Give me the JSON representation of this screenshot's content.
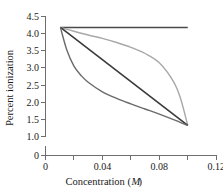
{
  "chart_data": {
    "type": "line",
    "title": "",
    "xlabel": "Concentration (M)",
    "xlabel_main": "Concentration (",
    "xlabel_italic": "M",
    "xlabel_close": ")",
    "ylabel": "Percent ionization",
    "xlim": [
      0,
      0.12
    ],
    "ylim": [
      1.0,
      4.5
    ],
    "y_axis_break": true,
    "y_zero_shown": true,
    "grid": false,
    "legend": "none",
    "xticks": [
      0,
      0.02,
      0.04,
      0.06,
      0.08,
      0.1,
      0.12
    ],
    "xtick_labels": [
      "0",
      "",
      "0.04",
      "",
      "0.08",
      "",
      "0.12"
    ],
    "yticks": [
      1.0,
      1.5,
      2.0,
      2.5,
      3.0,
      3.5,
      4.0,
      4.5
    ],
    "ytick_labels": [
      "1.0",
      "1.5",
      "2.0",
      "2.5",
      "3.0",
      "3.5",
      "4.0",
      "4.5"
    ],
    "y_origin_label": "0",
    "series": [
      {
        "name": "constant",
        "color": "#4a4a4a",
        "width": 1.6,
        "x": [
          0.0105,
          0.1
        ],
        "y": [
          4.18,
          4.18
        ]
      },
      {
        "name": "convex-upper",
        "color": "#a8a8a8",
        "width": 1.4,
        "x": [
          0.0105,
          0.02,
          0.03,
          0.04,
          0.05,
          0.06,
          0.07,
          0.08,
          0.09,
          0.095,
          0.1
        ],
        "y": [
          4.18,
          4.07,
          3.96,
          3.86,
          3.74,
          3.6,
          3.42,
          3.15,
          2.6,
          2.1,
          1.32
        ]
      },
      {
        "name": "linear-diagonal",
        "color": "#3a3a3a",
        "width": 1.6,
        "x": [
          0.0105,
          0.1
        ],
        "y": [
          4.18,
          1.32
        ]
      },
      {
        "name": "concave-lower",
        "color": "#6a6a6a",
        "width": 1.4,
        "x": [
          0.0105,
          0.015,
          0.02,
          0.025,
          0.03,
          0.04,
          0.05,
          0.06,
          0.07,
          0.08,
          0.09,
          0.1
        ],
        "y": [
          4.18,
          3.52,
          3.05,
          2.78,
          2.58,
          2.3,
          2.11,
          1.95,
          1.8,
          1.65,
          1.49,
          1.32
        ]
      }
    ]
  }
}
